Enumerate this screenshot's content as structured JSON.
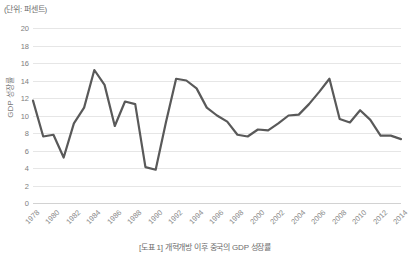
{
  "figure": {
    "unit_note": "(단위: 퍼센트)",
    "caption": "[도표 1] 개혁개방 이후 중국의 GDP 성장률",
    "line_color": "#595959",
    "grid_color": "#e6e6e6",
    "text_color": "#7b7b7b"
  },
  "chart_data": {
    "type": "line",
    "title": "[도표 1] 개혁개방 이후 중국의 GDP 성장률",
    "subtitle": "(단위: 퍼센트)",
    "xlabel": "",
    "ylabel": "GDP 성장률",
    "ylim": [
      0,
      20
    ],
    "ytick_step": 2,
    "yticks": [
      20,
      18,
      16,
      14,
      12,
      10,
      8,
      6,
      4,
      2,
      0
    ],
    "ytick_labels": [
      "20",
      "18",
      "16",
      "14",
      "12",
      "10",
      "8",
      "6",
      "4",
      "2",
      "0"
    ],
    "xlim": [
      1978,
      2014
    ],
    "xtick_step": 2,
    "xticks": [
      1978,
      1980,
      1982,
      1984,
      1986,
      1988,
      1990,
      1992,
      1994,
      1996,
      1998,
      2000,
      2002,
      2004,
      2006,
      2008,
      2010,
      2012,
      2014
    ],
    "xtick_labels": [
      "1978",
      "1980",
      "1982",
      "1984",
      "1986",
      "1988",
      "1990",
      "1992",
      "1994",
      "1996",
      "1998",
      "2000",
      "2002",
      "2004",
      "2006",
      "2008",
      "2010",
      "2012",
      "2014"
    ],
    "xtick_rotation": -45,
    "grid": true,
    "grid_axis": "y",
    "legend": false,
    "legend_position": "none",
    "x": [
      1978,
      1979,
      1980,
      1981,
      1982,
      1983,
      1984,
      1985,
      1986,
      1987,
      1988,
      1989,
      1990,
      1991,
      1992,
      1993,
      1994,
      1995,
      1996,
      1997,
      1998,
      1999,
      2000,
      2001,
      2002,
      2003,
      2004,
      2005,
      2006,
      2007,
      2008,
      2009,
      2010,
      2011,
      2012,
      2013,
      2014
    ],
    "values": [
      11.7,
      7.6,
      7.8,
      5.2,
      9.1,
      10.9,
      15.2,
      13.5,
      8.8,
      11.6,
      11.3,
      4.1,
      3.8,
      9.2,
      14.2,
      14.0,
      13.1,
      10.9,
      10.0,
      9.3,
      7.8,
      7.6,
      8.4,
      8.3,
      9.1,
      10.0,
      10.1,
      11.3,
      12.7,
      14.2,
      9.6,
      9.2,
      10.6,
      9.5,
      7.7,
      7.7,
      7.3
    ],
    "series": [
      {
        "name": "GDP 성장률",
        "values": [
          11.7,
          7.6,
          7.8,
          5.2,
          9.1,
          10.9,
          15.2,
          13.5,
          8.8,
          11.6,
          11.3,
          4.1,
          3.8,
          9.2,
          14.2,
          14.0,
          13.1,
          10.9,
          10.0,
          9.3,
          7.8,
          7.6,
          8.4,
          8.3,
          9.1,
          10.0,
          10.1,
          11.3,
          12.7,
          14.2,
          9.6,
          9.2,
          10.6,
          9.5,
          7.7,
          7.7,
          7.3
        ]
      }
    ]
  }
}
